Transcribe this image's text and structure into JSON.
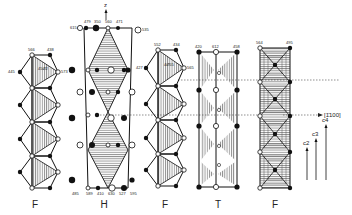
{
  "figure": {
    "axis_z_label": "z",
    "direction_label": "[1̄100]",
    "c_labels": [
      "c2",
      "c3",
      "c4"
    ],
    "columns": [
      {
        "id": "F1",
        "label": "F",
        "type": "face-sharing octahedra chain",
        "top_labels": [
          "566",
          "438",
          "445",
          "573",
          "45Ø2"
        ]
      },
      {
        "id": "H",
        "label": "H",
        "type": "hexagonal bipyramid chain",
        "top_labels": [
          "615",
          "479",
          "350",
          "560",
          "471",
          "535"
        ],
        "bottom_labels": [
          "485",
          "589",
          "410",
          "630",
          "527",
          "595"
        ]
      },
      {
        "id": "F2",
        "label": "F",
        "type": "face-sharing octahedra chain",
        "top_labels": [
          "552",
          "434",
          "427",
          "565",
          "4Ø55"
        ]
      },
      {
        "id": "T",
        "label": "T",
        "type": "trigonal prism chain",
        "top_labels": [
          "420",
          "612",
          "458"
        ]
      },
      {
        "id": "F3",
        "label": "F",
        "type": "octahedra chain (plan view)",
        "top_labels": [
          "564",
          "495"
        ]
      }
    ]
  }
}
